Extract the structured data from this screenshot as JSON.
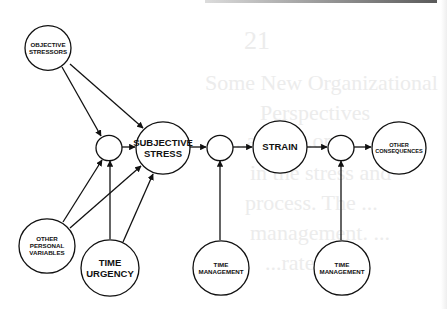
{
  "diagram": {
    "nodes": [
      {
        "id": "objective_stressors",
        "lines": [
          "OBJECTIVE",
          "STRESSORS"
        ],
        "cx": 48,
        "cy": 48,
        "r": 23,
        "fs": 6.2
      },
      {
        "id": "mod1",
        "lines": [],
        "cx": 109,
        "cy": 148,
        "r": 13,
        "fs": 0
      },
      {
        "id": "subjective_stress",
        "lines": [
          "SUBJECTIVE",
          "STRESS"
        ],
        "cx": 163,
        "cy": 148,
        "r": 27,
        "fs": 9.5
      },
      {
        "id": "mod2",
        "lines": [],
        "cx": 220,
        "cy": 148,
        "r": 13,
        "fs": 0
      },
      {
        "id": "strain",
        "lines": [
          "STRAIN"
        ],
        "cx": 280,
        "cy": 147,
        "r": 27,
        "fs": 9.5
      },
      {
        "id": "mod3",
        "lines": [],
        "cx": 341,
        "cy": 148,
        "r": 13,
        "fs": 0
      },
      {
        "id": "other_consequences",
        "lines": [
          "OTHER",
          "CONSEQUENCES"
        ],
        "cx": 399,
        "cy": 148,
        "r": 27,
        "fs": 5.6
      },
      {
        "id": "other_personal_variables",
        "lines": [
          "OTHER",
          "PERSONAL",
          "VARIABLES"
        ],
        "cx": 47,
        "cy": 246,
        "r": 28,
        "fs": 6.2
      },
      {
        "id": "time_urgency",
        "lines": [
          "TIME",
          "URGENCY"
        ],
        "cx": 110,
        "cy": 268,
        "r": 29,
        "fs": 9.5
      },
      {
        "id": "time_management_1",
        "lines": [
          "TIME",
          "MANAGEMENT"
        ],
        "cx": 221,
        "cy": 268,
        "r": 28,
        "fs": 6.2
      },
      {
        "id": "time_management_2",
        "lines": [
          "TIME",
          "MANAGEMENT"
        ],
        "cx": 342,
        "cy": 268,
        "r": 28,
        "fs": 6.2
      }
    ],
    "edges": [
      {
        "from": "objective_stressors",
        "to": "mod1",
        "x1": 62,
        "y1": 67,
        "x2": 101,
        "y2": 136
      },
      {
        "from": "objective_stressors",
        "to": "subjective_stress",
        "x1": 70,
        "y1": 64,
        "x2": 143,
        "y2": 128
      },
      {
        "from": "mod1",
        "to": "subjective_stress",
        "x1": 122,
        "y1": 147,
        "x2": 135,
        "y2": 147
      },
      {
        "from": "other_personal_variables",
        "to": "mod1",
        "x1": 63,
        "y1": 222,
        "x2": 102,
        "y2": 160
      },
      {
        "from": "other_personal_variables",
        "to": "subjective_stress",
        "x1": 70,
        "y1": 228,
        "x2": 141,
        "y2": 166
      },
      {
        "from": "time_urgency",
        "to": "mod1",
        "x1": 110,
        "y1": 239,
        "x2": 110,
        "y2": 161
      },
      {
        "from": "time_urgency",
        "to": "subjective_stress",
        "x1": 123,
        "y1": 242,
        "x2": 153,
        "y2": 174
      },
      {
        "from": "subjective_stress",
        "to": "mod2",
        "x1": 190,
        "y1": 147,
        "x2": 206,
        "y2": 147
      },
      {
        "from": "mod2",
        "to": "strain",
        "x1": 233,
        "y1": 147,
        "x2": 252,
        "y2": 147
      },
      {
        "from": "time_management_1",
        "to": "mod2",
        "x1": 220,
        "y1": 240,
        "x2": 220,
        "y2": 161
      },
      {
        "from": "strain",
        "to": "mod3",
        "x1": 307,
        "y1": 147,
        "x2": 327,
        "y2": 147
      },
      {
        "from": "mod3",
        "to": "other_consequences",
        "x1": 354,
        "y1": 147,
        "x2": 371,
        "y2": 147
      },
      {
        "from": "time_management_2",
        "to": "mod3",
        "x1": 341,
        "y1": 240,
        "x2": 341,
        "y2": 161
      }
    ]
  },
  "bleed_through": {
    "page_number": "21",
    "lines": [
      "Some New Organizational",
      "Perspectives",
      "...ation ...ons",
      "in the stress and",
      "process. The ...",
      "management. ...",
      "...rate ..."
    ]
  }
}
